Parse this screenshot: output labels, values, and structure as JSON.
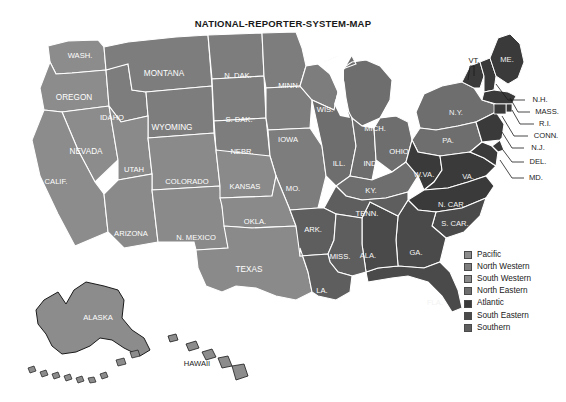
{
  "title": "NATIONAL-REPORTER-SYSTEM-MAP",
  "legend": {
    "items": [
      {
        "label": "Pacific",
        "color": "#8c8c8c"
      },
      {
        "label": "North Western",
        "color": "#7d7d7d"
      },
      {
        "label": "South Western",
        "color": "#8a8a8a"
      },
      {
        "label": "North Eastern",
        "color": "#6e6e6e"
      },
      {
        "label": "Atlantic",
        "color": "#3a3a3a"
      },
      {
        "label": "South Eastern",
        "color": "#4a4a4a"
      },
      {
        "label": "Southern",
        "color": "#5e5e5e"
      }
    ]
  },
  "regions": {
    "pacific": "#8c8c8c",
    "north_western": "#7d7d7d",
    "south_western": "#8a8a8a",
    "north_eastern": "#6e6e6e",
    "atlantic": "#3a3a3a",
    "south_eastern": "#4a4a4a",
    "southern": "#5e5e5e",
    "border": "#ffffff",
    "outline": "#1a1a1a"
  },
  "states": {
    "wash": "WASH.",
    "oregon": "OREGON",
    "idaho": "IDAHO",
    "montana": "MONTANA",
    "wyoming": "WYOMING",
    "nevada": "NEVADA",
    "utah": "UTAH",
    "calif": "CALIF.",
    "arizona": "ARIZONA",
    "n_mexico": "N. MEXICO",
    "colorado": "COLORADO",
    "n_dak": "N. DAK.",
    "s_dak": "S. DAK.",
    "nebr": "NEBR.",
    "kansas": "KANSAS",
    "okla": "OKLA.",
    "texas": "TEXAS",
    "minn": "MINN.",
    "iowa": "IOWA",
    "mo": "MO.",
    "ark": "ARK.",
    "la": "LA.",
    "wis": "WIS.",
    "ill": "ILL.",
    "mich": "MICH.",
    "ind": "IND.",
    "ohio": "OHIO",
    "ky": "KY.",
    "tenn": "TENN.",
    "miss": "MISS.",
    "ala": "ALA.",
    "ga": "GA.",
    "fla": "FLA.",
    "s_car": "S. CAR.",
    "n_car": "N. CAR.",
    "va": "VA.",
    "w_va": "W.VA.",
    "md": "MD.",
    "del": "DEL.",
    "n_j": "N.J.",
    "pa": "PA.",
    "n_y": "N.Y.",
    "vt": "VT.",
    "n_h": "N.H.",
    "me": "ME.",
    "mass": "MASS.",
    "r_i": "R.I.",
    "conn": "CONN.",
    "alaska": "ALASKA",
    "hawaii": "HAWAII"
  }
}
